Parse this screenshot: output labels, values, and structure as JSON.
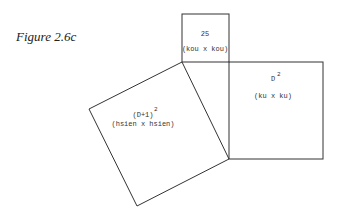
{
  "figure": {
    "caption": "Figure 2.6c"
  },
  "squares": {
    "small": {
      "value": "25",
      "expr": "(kou x kou)"
    },
    "right": {
      "base": "D",
      "exp": "2",
      "expr": "(ku x ku)"
    },
    "tilted": {
      "base": "(D+1)",
      "exp": "2",
      "expr": "(hsien x hsien)"
    }
  }
}
